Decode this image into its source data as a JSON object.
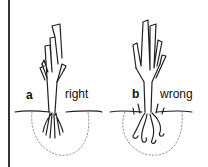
{
  "figure": {
    "panels": [
      {
        "letter": "a",
        "caption": "right"
      },
      {
        "letter": "b",
        "caption": "wrong"
      }
    ]
  }
}
